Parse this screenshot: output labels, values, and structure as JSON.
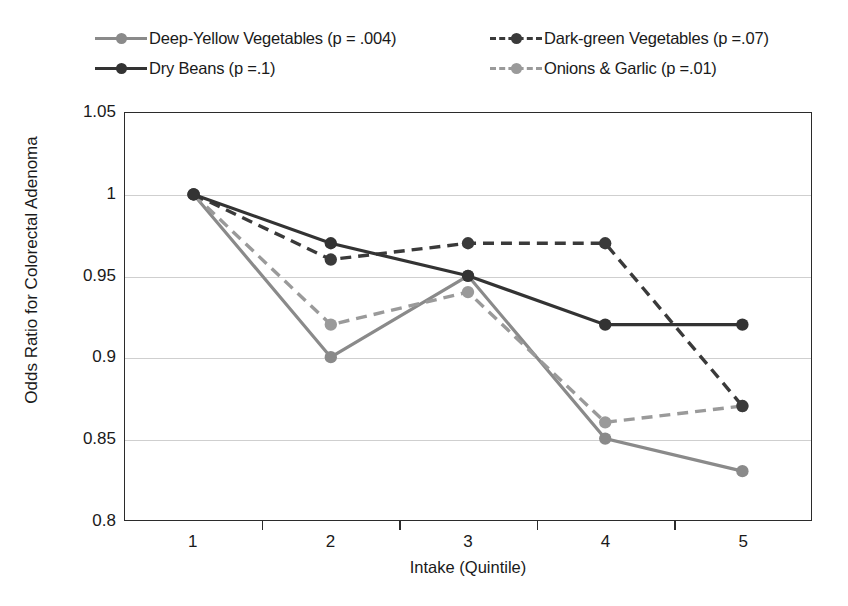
{
  "chart_data": {
    "type": "line",
    "title": "",
    "xlabel": "Intake (Quintile)",
    "ylabel": "Odds Ratio for Colorectal Adenoma",
    "categories": [
      "1",
      "2",
      "3",
      "4",
      "5"
    ],
    "x": [
      1,
      2,
      3,
      4,
      5
    ],
    "ylim": [
      0.8,
      1.05
    ],
    "yticks": [
      "0.8",
      "0.85",
      "0.9",
      "0.95",
      "1",
      "1.05"
    ],
    "ytick_values": [
      0.8,
      0.85,
      0.9,
      0.95,
      1.0,
      1.05
    ],
    "grid": "horizontal",
    "legend_position": "top",
    "series": [
      {
        "name": "Deep-Yellow Vegetables (p = .004)",
        "short_name": "Deep-Yellow Vegetables",
        "p_value": ".004",
        "values": [
          1.0,
          0.9,
          0.95,
          0.85,
          0.83
        ],
        "color": "#8a8a8a",
        "style": "solid",
        "marker": "circle"
      },
      {
        "name": "Dark-green Vegetables (p =.07)",
        "short_name": "Dark-green Vegetables",
        "p_value": ".07",
        "values": [
          1.0,
          0.96,
          0.97,
          0.97,
          0.87
        ],
        "color": "#3a3a3a",
        "style": "dashed",
        "marker": "circle"
      },
      {
        "name": "Dry Beans (p =.1)",
        "short_name": "Dry Beans",
        "p_value": ".1",
        "values": [
          1.0,
          0.97,
          0.95,
          0.92,
          0.92
        ],
        "color": "#333333",
        "style": "solid",
        "marker": "circle"
      },
      {
        "name": "Onions & Garlic (p =.01)",
        "short_name": "Onions & Garlic",
        "p_value": ".01",
        "values": [
          1.0,
          0.92,
          0.94,
          0.86,
          0.87
        ],
        "color": "#9a9a9a",
        "style": "dashed",
        "marker": "circle"
      }
    ]
  },
  "legend": {
    "rows": [
      {
        "left": "Deep-Yellow Vegetables (p = .004)",
        "right": "Dark-green Vegetables (p =.07)"
      },
      {
        "left": "Dry Beans (p =.1)",
        "right": "Onions & Garlic (p =.01)"
      }
    ]
  },
  "axes": {
    "x_title": "Intake (Quintile)",
    "y_title": "Odds Ratio for Colorectal Adenoma",
    "x_labels": [
      "1",
      "2",
      "3",
      "4",
      "5"
    ],
    "y_labels": [
      "1.05",
      "1",
      "0.95",
      "0.9",
      "0.85",
      "0.8"
    ]
  }
}
